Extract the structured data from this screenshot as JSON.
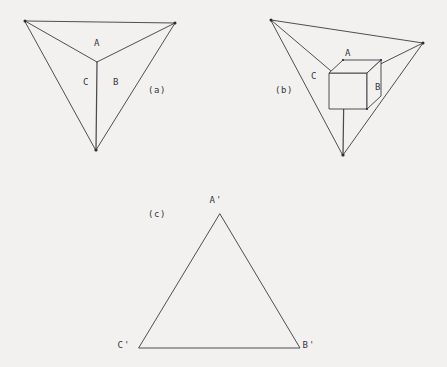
{
  "figure": {
    "background_color": "#f2f1ef",
    "line_color": "#3b3b42",
    "panels": [
      {
        "id": "a",
        "caption": "(a)",
        "caption_pos": {
          "x": 157,
          "y": 90
        },
        "description": "trihedral corner wireframe, concave vertex",
        "outer_triangle": [
          {
            "x": 25,
            "y": 21
          },
          {
            "x": 175,
            "y": 23
          },
          {
            "x": 96,
            "y": 150
          }
        ],
        "center_vertex": {
          "x": 97,
          "y": 62
        },
        "face_labels": [
          {
            "text": "A",
            "x": 97,
            "y": 43
          },
          {
            "text": "B",
            "x": 116,
            "y": 82
          },
          {
            "text": "C",
            "x": 86,
            "y": 82
          }
        ]
      },
      {
        "id": "b",
        "caption": "(b)",
        "caption_pos": {
          "x": 284,
          "y": 90
        },
        "description": "trihedral corner wireframe with cube occluding the vertex",
        "outer_triangle": [
          {
            "x": 271,
            "y": 20
          },
          {
            "x": 423,
            "y": 43
          },
          {
            "x": 343,
            "y": 155
          }
        ],
        "center_vertex": {
          "x": 344,
          "y": 82
        },
        "cube": {
          "front_top_left": {
            "x": 329,
            "y": 73
          },
          "width": 38,
          "height": 36,
          "depth_x": 14,
          "depth_y": -13
        },
        "face_labels": [
          {
            "text": "A",
            "x": 348,
            "y": 53
          },
          {
            "text": "B",
            "x": 378,
            "y": 87
          },
          {
            "text": "C",
            "x": 314,
            "y": 76
          }
        ]
      },
      {
        "id": "c",
        "caption": "(c)",
        "caption_pos": {
          "x": 157,
          "y": 214
        },
        "description": "plain triangle with primed vertex labels",
        "triangle": [
          {
            "x": 220,
            "y": 214
          },
          {
            "x": 300,
            "y": 348
          },
          {
            "x": 139,
            "y": 348
          }
        ],
        "vertex_labels": [
          {
            "text": "A'",
            "x": 216,
            "y": 200
          },
          {
            "text": "B'",
            "x": 309,
            "y": 345
          },
          {
            "text": "C'",
            "x": 124,
            "y": 345
          }
        ]
      }
    ]
  }
}
